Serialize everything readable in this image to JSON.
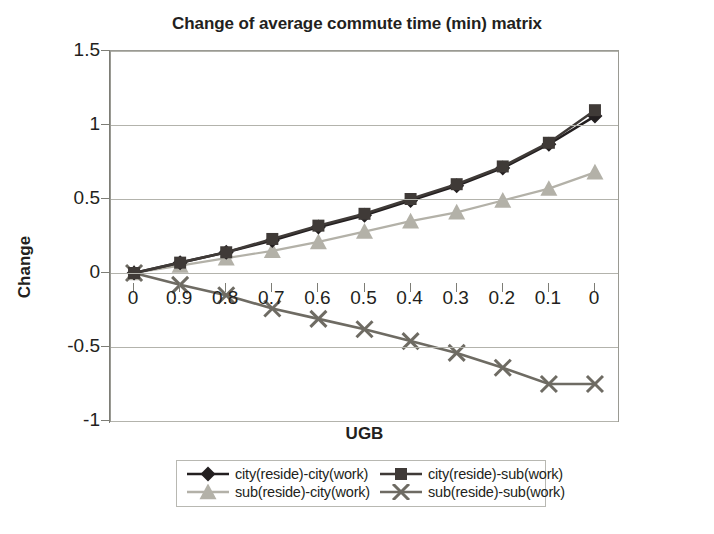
{
  "chart_data": {
    "type": "line",
    "title": "Change of average commute time (min) matrix",
    "xlabel": "UGB",
    "ylabel": "Change",
    "categories": [
      "0",
      "0.9",
      "0.8",
      "0.7",
      "0.6",
      "0.5",
      "0.4",
      "0.3",
      "0.2",
      "0.1",
      "0"
    ],
    "ylim": [
      -1,
      1.5
    ],
    "yticks": [
      1.5,
      1,
      0.5,
      0,
      -0.5,
      -1
    ],
    "ytick_labels": [
      "1.5",
      "1",
      "0.5",
      "0",
      "-0.5",
      "-1"
    ],
    "grid": true,
    "legend_position": "bottom",
    "series": [
      {
        "name": "city(reside)-city(work)",
        "marker": "diamond",
        "color": "#231f20",
        "values": [
          0,
          0.07,
          0.14,
          0.22,
          0.31,
          0.39,
          0.49,
          0.59,
          0.71,
          0.87,
          1.06
        ]
      },
      {
        "name": "city(reside)-sub(work)",
        "marker": "square",
        "color": "#3f3a37",
        "values": [
          0,
          0.07,
          0.14,
          0.23,
          0.32,
          0.4,
          0.5,
          0.6,
          0.72,
          0.88,
          1.1
        ]
      },
      {
        "name": "sub(reside)-city(work)",
        "marker": "triangle",
        "color": "#b3b1a8",
        "values": [
          0,
          0.05,
          0.1,
          0.15,
          0.21,
          0.28,
          0.35,
          0.41,
          0.49,
          0.57,
          0.68
        ]
      },
      {
        "name": "sub(reside)-sub(work)",
        "marker": "cross",
        "color": "#6e6b63",
        "values": [
          0,
          -0.08,
          -0.15,
          -0.24,
          -0.31,
          -0.38,
          -0.46,
          -0.54,
          -0.64,
          -0.75,
          -0.75
        ]
      }
    ]
  },
  "legend": {
    "items": [
      {
        "label": "city(reside)-city(work)"
      },
      {
        "label": "city(reside)-sub(work)"
      },
      {
        "label": "sub(reside)-city(work)"
      },
      {
        "label": "sub(reside)-sub(work)"
      }
    ]
  }
}
